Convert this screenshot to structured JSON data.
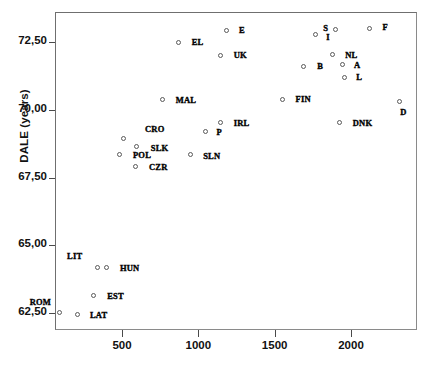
{
  "chart_data": {
    "type": "scatter",
    "title": "",
    "xlabel": "",
    "ylabel": "DALE (years)",
    "xlim": [
      0,
      2400
    ],
    "ylim": [
      61.6,
      73.6
    ],
    "grid": false,
    "legend": false,
    "xticks": [
      500,
      1000,
      1500,
      2000
    ],
    "xtick_labels": [
      "500",
      "1000",
      "1500",
      "2000"
    ],
    "yticks": [
      62.5,
      65.0,
      67.5,
      70.0,
      72.5
    ],
    "ytick_labels": [
      "62,50",
      "65,00",
      "67,50",
      "70,00",
      "72,50"
    ],
    "marker_style": "open-circle",
    "points": [
      {
        "label": "ROM",
        "x": 85,
        "y": 62.55,
        "lx": -30,
        "ly": -11
      },
      {
        "label": "LAT",
        "x": 205,
        "y": 62.48,
        "lx": 12,
        "ly": 0
      },
      {
        "label": "EST",
        "x": 305,
        "y": 63.2,
        "lx": 14,
        "ly": 1
      },
      {
        "label": "LIT",
        "x": 330,
        "y": 64.23,
        "lx": -30,
        "ly": -11
      },
      {
        "label": "HUN",
        "x": 395,
        "y": 64.23,
        "lx": 13,
        "ly": 1
      },
      {
        "label": "POL",
        "x": 480,
        "y": 68.4,
        "lx": 13,
        "ly": 1
      },
      {
        "label": "CRO",
        "x": 500,
        "y": 68.97,
        "lx": 22,
        "ly": -10
      },
      {
        "label": "SLK",
        "x": 590,
        "y": 68.68,
        "lx": 14,
        "ly": 1
      },
      {
        "label": "CZR",
        "x": 585,
        "y": 67.93,
        "lx": 13,
        "ly": 0
      },
      {
        "label": "SLN",
        "x": 940,
        "y": 68.37,
        "lx": 13,
        "ly": 1
      },
      {
        "label": "MAL",
        "x": 760,
        "y": 70.4,
        "lx": 13,
        "ly": 0
      },
      {
        "label": "P",
        "x": 1040,
        "y": 69.25,
        "lx": 11,
        "ly": 1
      },
      {
        "label": "IRL",
        "x": 1140,
        "y": 69.55,
        "lx": 13,
        "ly": 0
      },
      {
        "label": "EL",
        "x": 865,
        "y": 72.53,
        "lx": 13,
        "ly": 0
      },
      {
        "label": "E",
        "x": 1175,
        "y": 72.96,
        "lx": 13,
        "ly": -1
      },
      {
        "label": "UK",
        "x": 1140,
        "y": 72.05,
        "lx": 13,
        "ly": 0
      },
      {
        "label": "FIN",
        "x": 1545,
        "y": 70.42,
        "lx": 13,
        "ly": 0
      },
      {
        "label": "DNK",
        "x": 1920,
        "y": 69.55,
        "lx": 13,
        "ly": 0
      },
      {
        "label": "D",
        "x": 2310,
        "y": 70.34,
        "lx": 1,
        "ly": 10
      },
      {
        "label": "I",
        "x": 1760,
        "y": 72.8,
        "lx": 11,
        "ly": 2
      },
      {
        "label": "S",
        "x": 1890,
        "y": 73.0,
        "lx": -12,
        "ly": -1
      },
      {
        "label": "F",
        "x": 2115,
        "y": 73.05,
        "lx": 13,
        "ly": -1
      },
      {
        "label": "NL",
        "x": 1870,
        "y": 72.07,
        "lx": 13,
        "ly": 0
      },
      {
        "label": "B",
        "x": 1680,
        "y": 71.65,
        "lx": 14,
        "ly": 0
      },
      {
        "label": "A",
        "x": 1935,
        "y": 71.7,
        "lx": 12,
        "ly": 0
      },
      {
        "label": "L",
        "x": 1950,
        "y": 71.23,
        "lx": 12,
        "ly": 0
      }
    ]
  },
  "axes": {
    "y_title": "DALE (years)",
    "x_title": ""
  },
  "colors": {
    "frame": "#8a8a8a",
    "tick": "#4a4a4a",
    "marker_stroke": "#5a5a5a",
    "text": "#111111",
    "background": "#ffffff"
  }
}
